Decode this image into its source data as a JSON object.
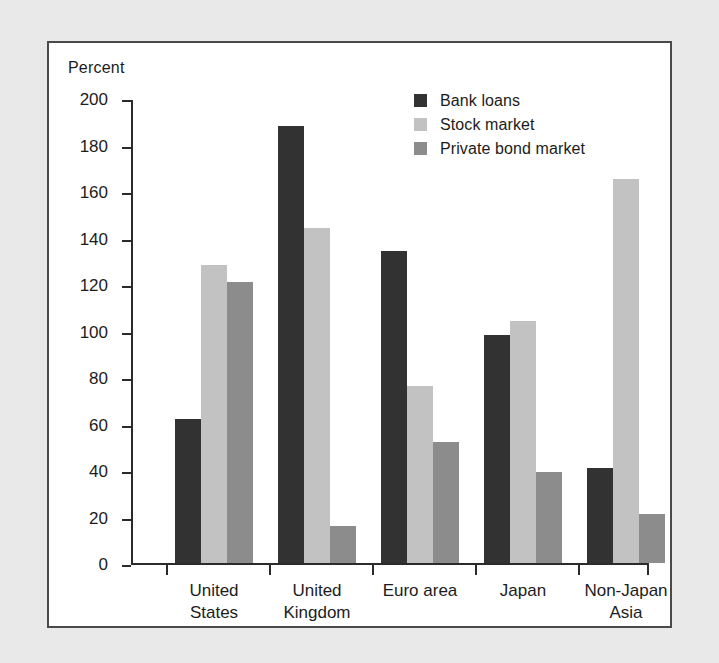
{
  "figure": {
    "axis_title": "Percent",
    "background": "#e9e9e9",
    "panel_background": "#ffffff",
    "frame_color": "#4a4a4a"
  },
  "legend": {
    "position": "top-right",
    "entries": [
      {
        "label": "Bank loans",
        "color": "#323232"
      },
      {
        "label": "Stock market",
        "color": "#c2c2c2"
      },
      {
        "label": "Private bond market",
        "color": "#8c8c8c"
      }
    ]
  },
  "axis": {
    "y_ticks": [
      "200",
      "180",
      "160",
      "140",
      "120",
      "100",
      "80",
      "60",
      "40",
      "20",
      "0"
    ],
    "y_min": 0,
    "y_max": 200,
    "y_step": 20
  },
  "chart_data": {
    "type": "bar",
    "title": "",
    "subtitle": "",
    "xlabel": "",
    "ylabel": "Percent",
    "ylim": [
      0,
      200
    ],
    "ytick_step": 20,
    "grid": false,
    "legend_position": "top-right",
    "categories": [
      "United\nStates",
      "United\nKingdom",
      "Euro area",
      "Japan",
      "Non-Japan Asia"
    ],
    "series": [
      {
        "name": "Bank loans",
        "color": "#323232",
        "values": [
          62,
          188,
          134,
          98,
          41
        ]
      },
      {
        "name": "Stock market",
        "color": "#c2c2c2",
        "values": [
          128,
          144,
          76,
          104,
          165
        ]
      },
      {
        "name": "Private bond market",
        "color": "#8c8c8c",
        "values": [
          121,
          16,
          52,
          39,
          21
        ]
      }
    ]
  }
}
